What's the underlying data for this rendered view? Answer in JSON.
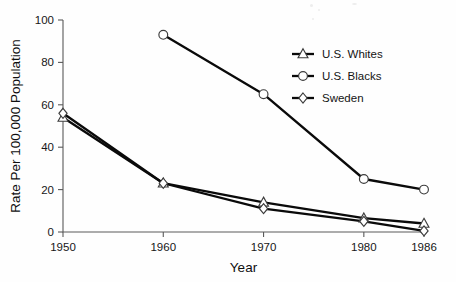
{
  "chart_data": {
    "type": "line",
    "title": "",
    "xlabel": "Year",
    "ylabel": "Rate Per 100,000 Population",
    "x": [
      1950,
      1960,
      1970,
      1980,
      1986
    ],
    "xtick_labels": [
      "1950",
      "1960",
      "1970",
      "1980",
      "1986"
    ],
    "ytick_labels": [
      "0",
      "20",
      "40",
      "60",
      "80",
      "100"
    ],
    "yticks": [
      0,
      20,
      40,
      60,
      80,
      100
    ],
    "ylim": [
      0,
      100
    ],
    "xlim": [
      1950,
      1986
    ],
    "grid": false,
    "legend_position": "upper right",
    "series": [
      {
        "name": "U.S. Whites",
        "marker": "triangle",
        "x": [
          1950,
          1960,
          1970,
          1980,
          1986
        ],
        "values": [
          54,
          23,
          14,
          6.5,
          4
        ]
      },
      {
        "name": "U.S. Blacks",
        "marker": "circle",
        "x": [
          1960,
          1970,
          1980,
          1986
        ],
        "values": [
          93,
          65,
          25,
          20
        ]
      },
      {
        "name": "Sweden",
        "marker": "diamond",
        "x": [
          1950,
          1960,
          1970,
          1980,
          1986
        ],
        "values": [
          56,
          23,
          11,
          5,
          0.5
        ]
      }
    ]
  },
  "legend": {
    "entries": [
      {
        "label": "U.S. Whites",
        "marker": "triangle"
      },
      {
        "label": "U.S. Blacks",
        "marker": "circle"
      },
      {
        "label": "Sweden",
        "marker": "diamond"
      }
    ]
  },
  "colors": {
    "line": "#0a0a0a",
    "marker_fill": "#ffffff",
    "marker_stroke": "#3c3c3c",
    "axis": "#5a5a5a",
    "text": "#141414",
    "background": "#fefefe"
  }
}
